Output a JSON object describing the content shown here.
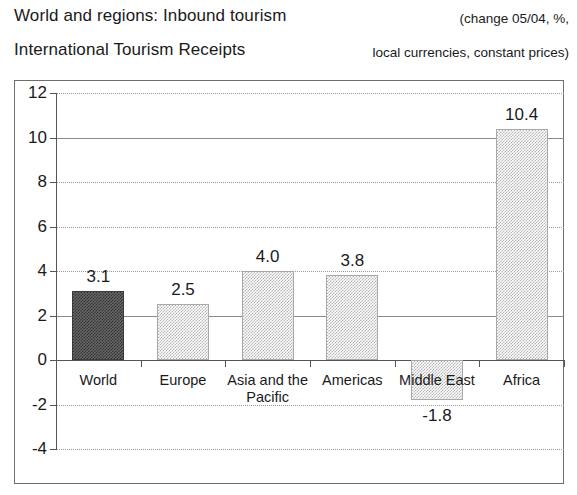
{
  "header": {
    "title_line1": "World and regions: Inbound tourism",
    "title_line2": "International Tourism Receipts",
    "note_line1": "(change 05/04, %,",
    "note_line2": "local currencies, constant prices)"
  },
  "chart_data": {
    "type": "bar",
    "subtitle": "(change 05/04, %, local currencies, constant prices)",
    "categories": [
      "World",
      "Europe",
      "Asia and the Pacific",
      "Americas",
      "Middle East",
      "Africa"
    ],
    "category_label_lines": [
      [
        "World"
      ],
      [
        "Europe"
      ],
      [
        "Asia and the",
        "Pacific"
      ],
      [
        "Americas"
      ],
      [
        "Middle East"
      ],
      [
        "Africa"
      ]
    ],
    "values": [
      3.1,
      2.5,
      4.0,
      3.8,
      -1.8,
      10.4
    ],
    "data_labels": [
      "3.1",
      "2.5",
      "4.0",
      "3.8",
      "-1.8",
      "10.4"
    ],
    "xlabel": "",
    "ylabel": "",
    "ylim": [
      -4,
      12
    ],
    "ytick_values": [
      12,
      10,
      8,
      6,
      4,
      2,
      0,
      -2,
      -4
    ],
    "ytick_labels": [
      "12",
      "10",
      "8",
      "6",
      "4",
      "2",
      "0",
      "-2",
      "-4"
    ],
    "solid_gridlines": [
      10,
      2
    ],
    "grid": true,
    "legend": false,
    "bar_colors": [
      "#3a3a3a",
      "#c8c8c8",
      "#c8c8c8",
      "#c8c8c8",
      "#c8c8c8",
      "#c8c8c8"
    ],
    "highlight_category": "World"
  }
}
